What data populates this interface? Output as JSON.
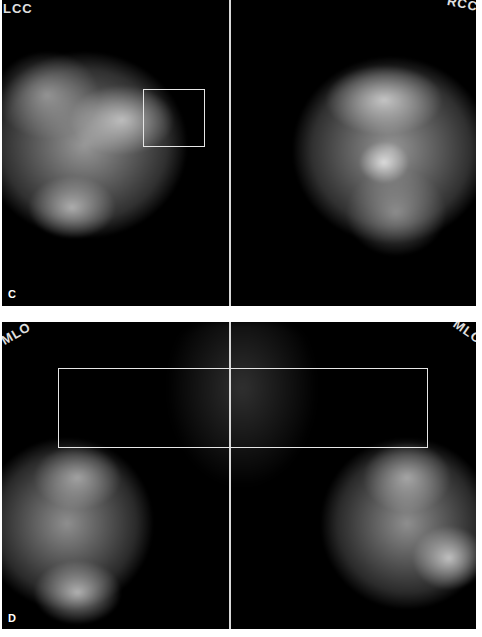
{
  "figure": {
    "panels": [
      {
        "id": "C",
        "label": "C",
        "view_markers": {
          "left": "LCC",
          "right": "RCC"
        },
        "roi_box": {
          "present": true,
          "position": "left breast upper-outer region"
        }
      },
      {
        "id": "D",
        "label": "D",
        "view_markers": {
          "left": "MLO",
          "right": "MLO"
        },
        "roi_box": {
          "present": true,
          "position": "spanning both breasts, upper region"
        }
      }
    ],
    "colors": {
      "background": "#000000",
      "page": "#ffffff",
      "roi_outline": "#e6e6e6",
      "label_text": "#ffffff"
    }
  }
}
